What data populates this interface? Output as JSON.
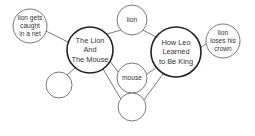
{
  "diagram": {
    "type": "double-bubble-map",
    "colors": {
      "stroke": "#444444",
      "text": "#333333",
      "background": "#ffffff"
    },
    "nodes": [
      {
        "id": "topic-left",
        "lines": [
          "The Lion",
          "And",
          "The Mouse"
        ],
        "cx": 90,
        "cy": 50,
        "r": 23,
        "weight": "bold"
      },
      {
        "id": "topic-right",
        "lines": [
          "How Leo",
          "Learned",
          "to Be King"
        ],
        "cx": 176,
        "cy": 52,
        "r": 25,
        "weight": "bold"
      },
      {
        "id": "left-detail-1",
        "lines": [
          "lion gets",
          "caught",
          "in a net"
        ],
        "cx": 30,
        "cy": 26,
        "r": 17
      },
      {
        "id": "left-detail-2",
        "lines": [],
        "cx": 59,
        "cy": 85,
        "r": 13
      },
      {
        "id": "shared-1",
        "lines": [
          "lion"
        ],
        "cx": 132,
        "cy": 20,
        "r": 15
      },
      {
        "id": "shared-2",
        "lines": [
          "mouse"
        ],
        "cx": 132,
        "cy": 78,
        "r": 15
      },
      {
        "id": "shared-3",
        "lines": [],
        "cx": 132,
        "cy": 107,
        "r": 14
      },
      {
        "id": "right-detail-1",
        "lines": [
          "lion",
          "loses his",
          "crown"
        ],
        "cx": 223,
        "cy": 41,
        "r": 17
      }
    ],
    "edges": [
      [
        "topic-left",
        "left-detail-1"
      ],
      [
        "topic-left",
        "left-detail-2"
      ],
      [
        "topic-left",
        "shared-1"
      ],
      [
        "topic-left",
        "shared-2"
      ],
      [
        "topic-left",
        "shared-3"
      ],
      [
        "topic-right",
        "shared-1"
      ],
      [
        "topic-right",
        "shared-2"
      ],
      [
        "topic-right",
        "shared-3"
      ],
      [
        "topic-right",
        "right-detail-1"
      ]
    ],
    "labels": {
      "topic_left": {
        "l1": "The Lion",
        "l2": "And",
        "l3": "The Mouse"
      },
      "topic_right": {
        "l1": "How Leo",
        "l2": "Learned",
        "l3": "to Be King"
      },
      "left_detail_1": {
        "l1": "lion gets",
        "l2": "caught",
        "l3": "in a net"
      },
      "shared_1": {
        "l1": "lion"
      },
      "shared_2": {
        "l1": "mouse"
      },
      "right_detail_1": {
        "l1": "lion",
        "l2": "loses his",
        "l3": "crown"
      }
    }
  }
}
